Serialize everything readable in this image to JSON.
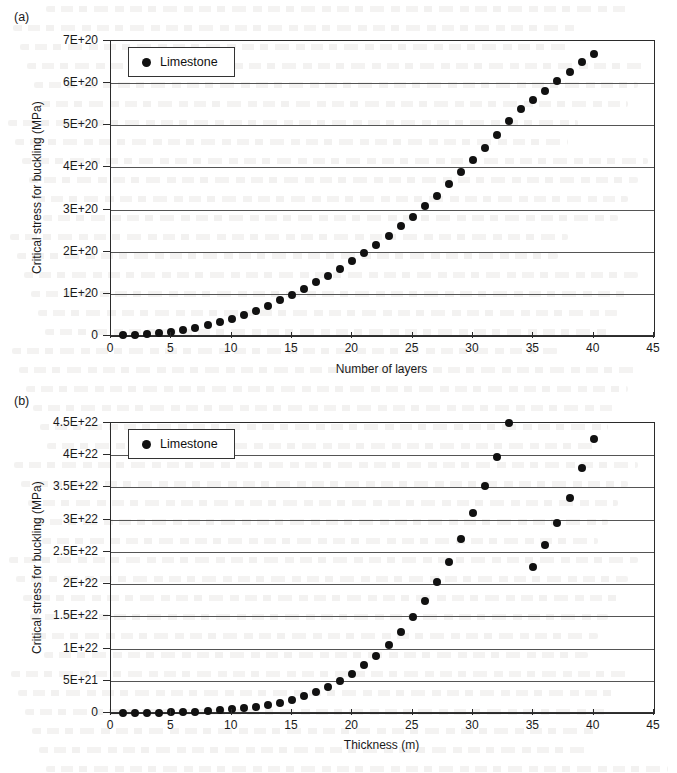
{
  "figure": {
    "panels": [
      {
        "label": "(a)",
        "legend_label": "Limestone",
        "ylabel": "Critical stress for buckling (MPa)",
        "xlabel": "Number of layers"
      },
      {
        "label": "(b)",
        "legend_label": "Limestone",
        "ylabel": "Critical stress for buckling (MPa)",
        "xlabel": "Thickness (m)"
      }
    ]
  },
  "chart_data": [
    {
      "type": "scatter",
      "title": "(a)",
      "xlabel": "Number of layers",
      "ylabel": "Critical stress for buckling (MPa)",
      "legend": [
        "Limestone"
      ],
      "legend_position": "top-left",
      "grid": true,
      "xlim": [
        0,
        45
      ],
      "ylim": [
        0,
        7e+20
      ],
      "xticks": [
        0,
        5,
        10,
        15,
        20,
        25,
        30,
        35,
        40,
        45
      ],
      "xtick_labels": [
        "0",
        "5",
        "10",
        "15",
        "20",
        "25",
        "30",
        "35",
        "40",
        "45"
      ],
      "yticks": [
        0,
        1e+20,
        2e+20,
        3e+20,
        4e+20,
        5e+20,
        6e+20,
        7e+20
      ],
      "ytick_labels": [
        "0",
        "1E+20",
        "2E+20",
        "3E+20",
        "4E+20",
        "5E+20",
        "6E+20",
        "7E+20"
      ],
      "series": [
        {
          "name": "Limestone",
          "x": [
            1,
            2,
            3,
            4,
            5,
            6,
            7,
            8,
            9,
            10,
            11,
            12,
            13,
            14,
            15,
            16,
            17,
            18,
            19,
            20,
            21,
            22,
            23,
            24,
            25,
            26,
            27,
            28,
            29,
            30,
            31,
            32,
            33,
            34,
            35,
            36,
            37,
            38,
            39,
            40
          ],
          "y": [
            2e+18,
            3e+18,
            4.5e+18,
            6e+18,
            9e+18,
            1.4e+19,
            2e+19,
            2.6e+19,
            3.3e+19,
            4.1e+19,
            5e+19,
            6e+19,
            7.2e+19,
            8.5e+19,
            9.8e+19,
            1.12e+20,
            1.27e+20,
            1.43e+20,
            1.6e+20,
            1.78e+20,
            1.97e+20,
            2.17e+20,
            2.38e+20,
            2.6e+20,
            2.83e+20,
            3.08e+20,
            3.33e+20,
            3.6e+20,
            3.88e+20,
            4.17e+20,
            4.47e+20,
            4.78e+20,
            5.1e+20,
            5.38e+20,
            5.6e+20,
            5.82e+20,
            6.04e+20,
            6.26e+20,
            6.5e+20,
            6.7e+20
          ]
        }
      ]
    },
    {
      "type": "scatter",
      "title": "(b)",
      "xlabel": "Thickness (m)",
      "ylabel": "Critical stress for buckling (MPa)",
      "legend": [
        "Limestone"
      ],
      "legend_position": "top-left",
      "grid": true,
      "xlim": [
        0,
        45
      ],
      "ylim": [
        0,
        4.5e+22
      ],
      "xticks": [
        0,
        5,
        10,
        15,
        20,
        25,
        30,
        35,
        40,
        45
      ],
      "xtick_labels": [
        "0",
        "5",
        "10",
        "15",
        "20",
        "25",
        "30",
        "35",
        "40",
        "45"
      ],
      "yticks": [
        0,
        5e+21,
        1e+22,
        1.5e+22,
        2e+22,
        2.5e+22,
        3e+22,
        3.5e+22,
        4e+22,
        4.5e+22
      ],
      "ytick_labels": [
        "0",
        "5E+21",
        "1E+22",
        "1.5E+22",
        "2E+22",
        "2.5E+22",
        "3E+22",
        "3.5E+22",
        "4E+22",
        "4.5E+22"
      ],
      "series": [
        {
          "name": "Limestone",
          "x": [
            1,
            2,
            3,
            4,
            5,
            6,
            7,
            8,
            9,
            10,
            11,
            12,
            13,
            14,
            15,
            16,
            17,
            18,
            19,
            20,
            21,
            22,
            23,
            24,
            25,
            26,
            27,
            28,
            29,
            30,
            31,
            32,
            33,
            34,
            35,
            36,
            37,
            38,
            39,
            40
          ],
          "y": [
            1e+19,
            2e+19,
            4e+19,
            7e+19,
            1.1e+20,
            1.6e+20,
            2.3e+20,
            3.2e+20,
            4.3e+20,
            5.7e+20,
            7.5e+20,
            9.6e+20,
            1.25e+21,
            1.6e+21,
            2.05e+21,
            2.6e+21,
            3.25e+21,
            4.05e+21,
            5e+21,
            6.1e+21,
            7.4e+21,
            8.9e+21,
            1.06e+22,
            1.26e+22,
            1.49e+22,
            1.74e+22,
            2.03e+22,
            2.35e+22,
            2.7e+22,
            3.1e+22,
            3.52e+22,
            3.98e+22,
            4.5e+22,
            5.05e+22,
            2.27e+22,
            2.6e+22,
            2.95e+22,
            3.33e+22,
            3.8e+22,
            4.25e+22
          ]
        }
      ]
    }
  ]
}
